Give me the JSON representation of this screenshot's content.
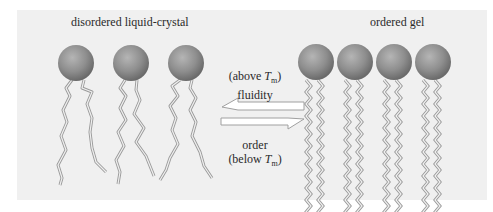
{
  "figure": {
    "left_state": {
      "title": "disordered liquid-crystal",
      "lipid_count": 3
    },
    "right_state": {
      "title": "ordered gel",
      "lipid_count": 4
    },
    "transition": {
      "top": {
        "condition_prefix": "(above ",
        "symbol": "T",
        "subscript": "m",
        "condition_suffix": ")",
        "property": "fluidity"
      },
      "bottom": {
        "property": "order",
        "condition_prefix": "(below ",
        "symbol": "T",
        "subscript": "m",
        "condition_suffix": ")"
      }
    },
    "colors": {
      "background": "#f0f0f0",
      "head": "#8c8c8c",
      "tail_outline": "#9a9a9a",
      "arrow_fill": "#ffffff",
      "arrow_stroke": "#a0a0a0"
    }
  }
}
